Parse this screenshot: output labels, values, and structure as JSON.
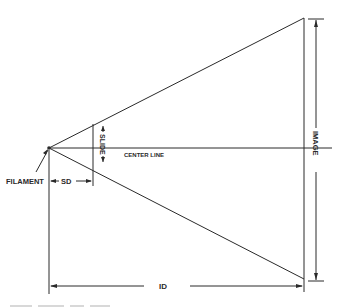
{
  "diagram": {
    "type": "projection-geometry",
    "labels": {
      "filament": "FILAMENT",
      "center_line": "CENTER LINE",
      "slide": "SLIDE",
      "image": "IMAGE",
      "sd": "SD",
      "id": "ID"
    },
    "colors": {
      "line": "#2a2a2a",
      "background": "#ffffff"
    }
  }
}
